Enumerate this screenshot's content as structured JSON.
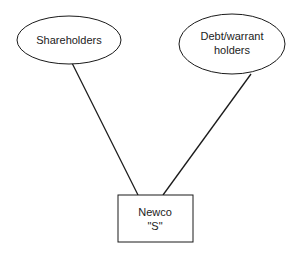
{
  "diagram": {
    "nodes": [
      {
        "id": "shareholders",
        "shape": "ellipse",
        "lines": [
          "Shareholders"
        ]
      },
      {
        "id": "debt_warrant_holders",
        "shape": "ellipse",
        "lines": [
          "Debt/warrant",
          "holders"
        ]
      },
      {
        "id": "newco",
        "shape": "rectangle",
        "lines": [
          "Newco",
          "\"S\""
        ]
      }
    ],
    "edges": [
      {
        "from": "shareholders",
        "to": "newco"
      },
      {
        "from": "debt_warrant_holders",
        "to": "newco"
      }
    ],
    "colors": {
      "stroke": "#1a1a1a",
      "text": "#222222",
      "background": "#ffffff"
    }
  }
}
